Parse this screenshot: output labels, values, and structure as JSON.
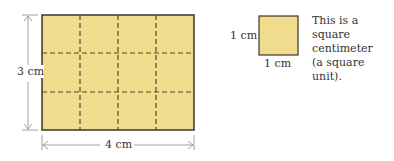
{
  "diagram": {
    "rectangle": {
      "width_label": "4 cm",
      "height_label": "3 cm",
      "cols": 4,
      "rows": 3,
      "fill": "#f0dc8c",
      "stroke": "#3a3530",
      "grid_color": "#5a4a30"
    },
    "unit_square": {
      "left_label": "1 cm",
      "bottom_label": "1 cm"
    },
    "description": {
      "line1": "This is a square",
      "line2": "centimeter",
      "line3": "(a square unit)."
    }
  }
}
